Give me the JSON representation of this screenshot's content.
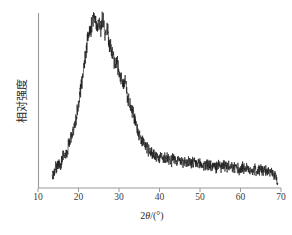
{
  "chart_data": {
    "type": "line",
    "title": "",
    "subtitle": "",
    "xlabel": "2θ/(°)",
    "ylabel": "相对强度",
    "xlabel_parts": {
      "prefix": "2",
      "italic_symbol": "θ",
      "suffix": "/(°)"
    },
    "xlim": [
      10,
      70
    ],
    "ylim": [
      0,
      100
    ],
    "xticks": [
      10,
      20,
      30,
      40,
      50,
      60,
      70
    ],
    "xtick_labels": [
      "10",
      "20",
      "30",
      "40",
      "50",
      "60",
      "70"
    ],
    "yticks": [],
    "ytick_labels": [],
    "grid": false,
    "legend": null,
    "legend_position": "none",
    "series_color": "#1a1a1a",
    "axis_color": "#9a9a9a",
    "background": "#ffffff",
    "annotations": [],
    "peak_center_2theta": 24,
    "data_start_2theta": 13.5,
    "data_end_2theta": 69.2,
    "x": [
      13.5,
      14.0,
      14.5,
      15.0,
      15.5,
      16.0,
      16.5,
      17.0,
      17.5,
      18.0,
      18.5,
      19.0,
      19.5,
      20.0,
      20.5,
      21.0,
      21.5,
      22.0,
      22.5,
      23.0,
      23.5,
      24.0,
      24.5,
      25.0,
      25.5,
      26.0,
      26.5,
      27.0,
      27.5,
      28.0,
      28.5,
      29.0,
      29.5,
      30.0,
      30.5,
      31.0,
      31.5,
      32.0,
      32.5,
      33.0,
      33.5,
      34.0,
      34.5,
      35.0,
      35.5,
      36.0,
      36.5,
      37.0,
      37.5,
      38.0,
      38.5,
      39.0,
      39.5,
      40.0,
      40.5,
      41.0,
      41.5,
      42.0,
      42.5,
      43.0,
      43.5,
      44.0,
      44.5,
      45.0,
      45.5,
      46.0,
      46.5,
      47.0,
      47.5,
      48.0,
      48.5,
      49.0,
      49.5,
      50.0,
      50.5,
      51.0,
      51.5,
      52.0,
      52.5,
      53.0,
      53.5,
      54.0,
      54.5,
      55.0,
      55.5,
      56.0,
      56.5,
      57.0,
      57.5,
      58.0,
      58.5,
      59.0,
      59.5,
      60.0,
      60.5,
      61.0,
      61.5,
      62.0,
      62.5,
      63.0,
      63.5,
      64.0,
      64.5,
      65.0,
      65.5,
      66.0,
      66.5,
      67.0,
      67.5,
      68.0,
      68.5,
      69.0,
      69.2
    ],
    "y": [
      6,
      9,
      12,
      14,
      13,
      17,
      20,
      19,
      24,
      28,
      31,
      36,
      41,
      48,
      56,
      64,
      72,
      81,
      87,
      91,
      95,
      97,
      93,
      96,
      91,
      98,
      89,
      92,
      84,
      80,
      77,
      70,
      73,
      66,
      62,
      58,
      61,
      54,
      48,
      46,
      42,
      38,
      34,
      31,
      28,
      26,
      24,
      23,
      21,
      20,
      19,
      19,
      18,
      17,
      18,
      17,
      17,
      18,
      17,
      16,
      17,
      16,
      16,
      15,
      16,
      15,
      15,
      14,
      15,
      14,
      14,
      14,
      13,
      14,
      13,
      13,
      14,
      13,
      13,
      12,
      13,
      12,
      13,
      12,
      12,
      13,
      12,
      12,
      11,
      12,
      11,
      12,
      11,
      11,
      12,
      11,
      11,
      10,
      11,
      10,
      11,
      10,
      10,
      11,
      10,
      10,
      9,
      10,
      9,
      8,
      7,
      5,
      2
    ],
    "noise_amplitude": 3.5,
    "units": {
      "x": "degrees",
      "y": "arbitrary"
    }
  },
  "figure": {
    "caption": "",
    "plot_area": {
      "left": 38,
      "top": 13,
      "right": 281,
      "bottom": 188
    }
  }
}
